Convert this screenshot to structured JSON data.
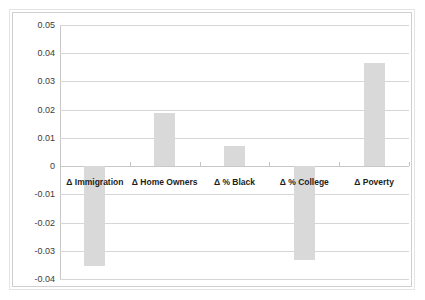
{
  "chart_data": {
    "type": "bar",
    "title": "",
    "subtitle": "",
    "xlabel": "",
    "ylabel": "",
    "categories": [
      "Δ Immigration",
      "Δ Home Owners",
      "Δ % Black",
      "Δ % College",
      "Δ Poverty"
    ],
    "values": [
      -0.0355,
      0.0187,
      0.0073,
      -0.0332,
      0.0364
    ],
    "ylim": [
      -0.04,
      0.05
    ],
    "ytick_labels": [
      "0.05",
      "0.04",
      "0.03",
      "0.02",
      "0.01",
      "0",
      "-0.01",
      "-0.02",
      "-0.03",
      "-0.04"
    ],
    "ytick_values": [
      0.05,
      0.04,
      0.03,
      0.02,
      0.01,
      0,
      -0.01,
      -0.02,
      -0.03,
      -0.04
    ],
    "ystep": 0.01,
    "grid": true,
    "legend": false,
    "legend_position": "none",
    "series": [
      {
        "name": "",
        "values": [
          -0.0355,
          0.0187,
          0.0073,
          -0.0332,
          0.0364
        ]
      }
    ],
    "bar_color": "#d9d9d9",
    "gridline_color": "#d6d6d6",
    "axis_color": "#c8c8c8",
    "background_color": "#ffffff",
    "label_color": "#1d1d1d",
    "tick_label_color": "#3b3b3b"
  }
}
